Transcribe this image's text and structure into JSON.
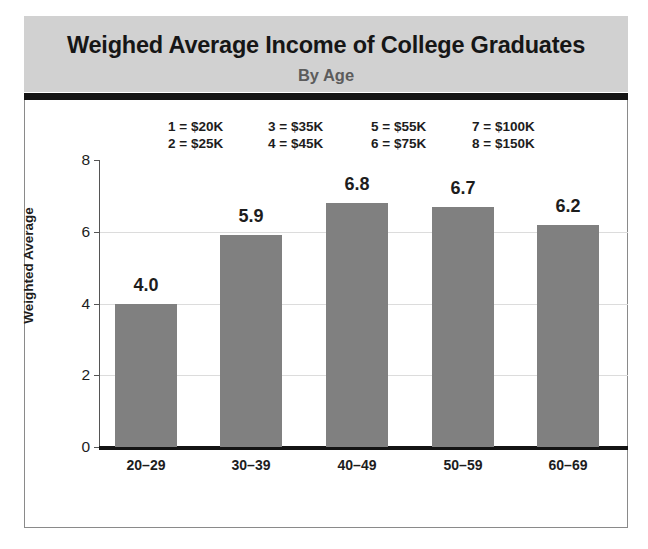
{
  "header": {
    "title": "Weighed Average Income of College Graduates",
    "subtitle": "By Age",
    "band_color": "#d1d1d1",
    "rule_color": "#131313"
  },
  "legend": {
    "columns": [
      {
        "lines": [
          "1 = $20K",
          "2 = $25K"
        ]
      },
      {
        "lines": [
          "3 = $35K",
          "4 = $45K"
        ]
      },
      {
        "lines": [
          "5 = $55K",
          "6 = $75K"
        ]
      },
      {
        "lines": [
          "7 = $100K",
          "8 = $150K"
        ]
      }
    ],
    "entries": [
      {
        "code": "1",
        "value": "$20K"
      },
      {
        "code": "2",
        "value": "$25K"
      },
      {
        "code": "3",
        "value": "$35K"
      },
      {
        "code": "4",
        "value": "$45K"
      },
      {
        "code": "5",
        "value": "$55K"
      },
      {
        "code": "6",
        "value": "$75K"
      },
      {
        "code": "7",
        "value": "$100K"
      },
      {
        "code": "8",
        "value": "$150K"
      }
    ]
  },
  "chart_data": {
    "type": "bar",
    "title": "Weighed Average Income of College Graduates",
    "subtitle": "By Age",
    "categories": [
      "20–29",
      "30–39",
      "40–49",
      "50–59",
      "60–69"
    ],
    "values": [
      4.0,
      5.9,
      6.8,
      6.7,
      6.2
    ],
    "data_labels": [
      "4.0",
      "5.9",
      "6.8",
      "6.7",
      "6.2"
    ],
    "xlabel": "",
    "ylabel": "Weighted Average",
    "ylim": [
      0,
      8
    ],
    "yticks": [
      0,
      2,
      4,
      6,
      8
    ],
    "ytick_labels": [
      "0",
      "2",
      "4",
      "6",
      "8"
    ],
    "grid": true,
    "grid_axis": "y",
    "legend_position": "top",
    "bar_color": "#808080",
    "background_color": "#ffffff"
  }
}
